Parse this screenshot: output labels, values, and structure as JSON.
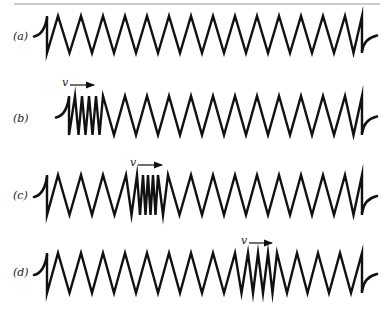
{
  "figure": {
    "top_rule": {
      "x1": 14,
      "x2": 380,
      "y": 4,
      "color": "#9a9a9a"
    },
    "stroke_color": "#111111",
    "springs": [
      {
        "label": "(a)",
        "label_pos": [
          13,
          37
        ],
        "y_top": 16,
        "y_bot": 53,
        "left_hook": [
          36,
          36
        ],
        "velocity": null,
        "peaks_x": [
          47,
          58,
          81,
          103,
          125,
          147,
          169,
          191,
          213,
          235,
          257,
          279,
          301,
          323,
          345,
          362
        ]
      },
      {
        "label": "(b)",
        "label_pos": [
          13,
          119
        ],
        "y_top": 96,
        "y_bot": 135,
        "left_hook": [
          52,
          114
        ],
        "velocity": {
          "label": "v",
          "x": 62,
          "y": 85,
          "arrow_x1": 70,
          "arrow_x2": 94
        },
        "peaks_x": [
          69,
          75,
          82,
          89,
          96,
          103,
          125,
          147,
          169,
          191,
          213,
          235,
          257,
          279,
          301,
          323,
          345,
          362
        ]
      },
      {
        "label": "(c)",
        "label_pos": [
          13,
          196
        ],
        "y_top": 175,
        "y_bot": 215,
        "left_hook": [
          36,
          193
        ],
        "velocity": {
          "label": "v",
          "x": 130,
          "y": 165,
          "arrow_x1": 138,
          "arrow_x2": 162
        },
        "peaks_x": [
          47,
          58,
          81,
          103,
          126,
          137,
          143,
          148,
          153,
          158,
          168,
          191,
          213,
          235,
          257,
          279,
          301,
          323,
          345,
          362
        ]
      },
      {
        "label": "(d)",
        "label_pos": [
          13,
          273
        ],
        "y_top": 253,
        "y_bot": 293,
        "left_hook": [
          36,
          272
        ],
        "velocity": {
          "label": "v",
          "x": 241,
          "y": 243,
          "arrow_x1": 249,
          "arrow_x2": 272
        },
        "peaks_x": [
          47,
          58,
          81,
          103,
          125,
          147,
          169,
          191,
          213,
          235,
          248,
          258,
          268,
          277,
          297,
          318,
          340,
          362
        ]
      }
    ],
    "caption": "Compression pulse (region of closely spaced coils) traveling along a spring with velocity v"
  }
}
